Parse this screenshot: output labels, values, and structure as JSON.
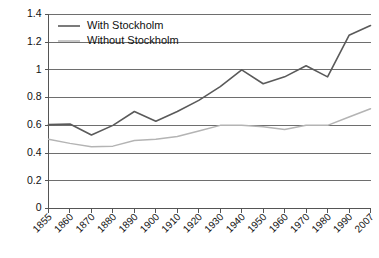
{
  "chart_data": {
    "type": "line",
    "title": "",
    "xlabel": "",
    "ylabel": "",
    "ylim": [
      0,
      1.4
    ],
    "ytick_step": 0.2,
    "grid": true,
    "legend_position": "top-left",
    "categories": [
      "1855",
      "1860",
      "1870",
      "1880",
      "1890",
      "1900",
      "1910",
      "1920",
      "1930",
      "1940",
      "1950",
      "1960",
      "1970",
      "1980",
      "1990",
      "2007"
    ],
    "ytick_labels": [
      "1.4",
      "1.2",
      "1",
      "0.8",
      "0.6",
      "0.4",
      "0.2",
      "0"
    ],
    "ytick_values": [
      1.4,
      1.2,
      1.0,
      0.8,
      0.6,
      0.4,
      0.2,
      0
    ],
    "series": [
      {
        "name": "With Stockholm",
        "color": "#5a5a5a",
        "width": 1.6,
        "values": [
          0.605,
          0.61,
          0.53,
          0.6,
          0.7,
          0.63,
          0.7,
          0.78,
          0.88,
          1.0,
          0.9,
          0.95,
          1.03,
          0.95,
          1.25,
          1.32
        ]
      },
      {
        "name": "Without Stockholm",
        "color": "#b4b4b4",
        "width": 1.5,
        "values": [
          0.5,
          0.47,
          0.445,
          0.45,
          0.49,
          0.5,
          0.52,
          0.56,
          0.6,
          0.6,
          0.59,
          0.57,
          0.6,
          0.6,
          0.66,
          0.72
        ]
      }
    ]
  },
  "legend": {
    "items": [
      {
        "label": "With Stockholm",
        "color": "#5a5a5a"
      },
      {
        "label": "Without Stockholm",
        "color": "#b4b4b4"
      }
    ]
  },
  "axes": {
    "gridline_color": "#6e6e6e",
    "axis_color": "#555555"
  }
}
